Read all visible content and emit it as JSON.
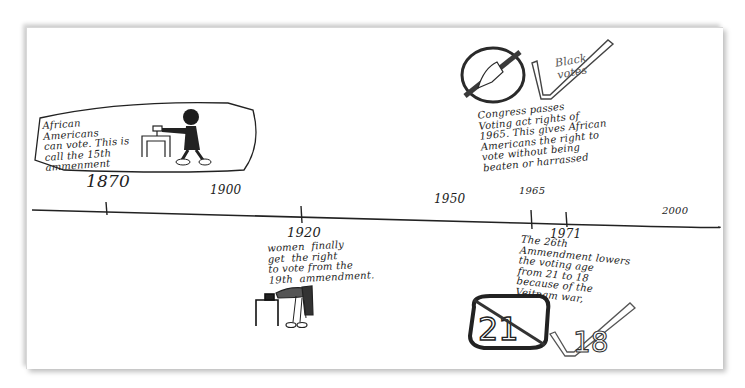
{
  "timeline": {
    "title": "",
    "axis_labels": [
      {
        "label": "1900",
        "x": 210,
        "y": 192
      },
      {
        "label": "1950",
        "x": 434,
        "y": 199
      },
      {
        "label": "2000",
        "x": 660,
        "y": 210
      }
    ],
    "ticks": [
      {
        "year": "1870",
        "x": 106
      },
      {
        "year": "1920",
        "x": 301
      },
      {
        "year": "1965",
        "x": 531
      },
      {
        "year": "1971",
        "x": 566
      }
    ]
  },
  "events": [
    {
      "id": "1870",
      "year": "1870",
      "text": "African\nAmericans\ncan vote. This is\ncall the 15th\nammenment",
      "illustration": "man-voting-at-ballot-box"
    },
    {
      "id": "1920",
      "year": "1920",
      "text": "women  finally\nget  the right\nto vote from the\n19th  ammendment.",
      "illustration": "woman-voting-at-ballot-box"
    },
    {
      "id": "1965",
      "year": "1965",
      "text": "Congress passes\nVoting act rights of\n1965. This gives African\nAmericans the right to\nvote without being\nbeaten or harrassed",
      "illustration": "crossed-out-hand-and-checkmark",
      "caption": "Black\nvotes"
    },
    {
      "id": "1971",
      "year": "1971",
      "text": "The 26th\nAmmendment lowers\nthe voting age\nfrom 21 to 18\nbecause of the\nVeitnam war,",
      "illustration": "crossed-out-21-and-checkmark-18",
      "old_age": "21",
      "new_age": "18"
    }
  ],
  "colors": {
    "ink": "#1d1d1d",
    "pencil": "#555555",
    "paper": "#ffffff",
    "shadow": "#bdbdbd"
  }
}
